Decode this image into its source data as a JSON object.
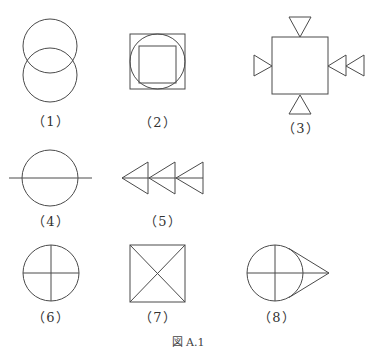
{
  "figure": {
    "caption": "図 A.1",
    "items": [
      {
        "id": 1,
        "label": "（1）",
        "description": "two vertically overlapping circles"
      },
      {
        "id": 2,
        "label": "（2）",
        "description": "square with inscribed circle containing inscribed square"
      },
      {
        "id": 3,
        "label": "（3）",
        "description": "square with triangles on each side, two triangles on right"
      },
      {
        "id": 4,
        "label": "（4）",
        "description": "circle with horizontal line through center"
      },
      {
        "id": 5,
        "label": "（5）",
        "description": "three left-pointing triangles on a horizontal line"
      },
      {
        "id": 6,
        "label": "（6）",
        "description": "circle divided by horizontal and vertical diameters"
      },
      {
        "id": 7,
        "label": "（7）",
        "description": "square with both diagonals"
      },
      {
        "id": 8,
        "label": "（8）",
        "description": "circle with cross and tangent lines to a point on the right"
      }
    ]
  },
  "colors": {
    "stroke": "#4a4a4a",
    "background": "#ffffff"
  }
}
